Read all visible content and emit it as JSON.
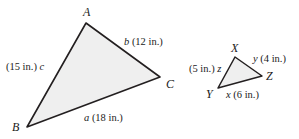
{
  "figure": {
    "background_color": "#ffffff",
    "stroke_color": "#231f20",
    "fill_color": "#efefef"
  },
  "triangle_abc": {
    "name": "Triangle ABC",
    "vertices": [
      {
        "label": "A",
        "x": 86,
        "y": 23
      },
      {
        "label": "B",
        "x": 27,
        "y": 127
      },
      {
        "label": "C",
        "x": 160,
        "y": 77
      }
    ],
    "sides": [
      {
        "var": "a",
        "measure": "(18 in.)",
        "text": "a (18 in.)",
        "length": 18,
        "unit": "in.",
        "between": "B-C"
      },
      {
        "var": "b",
        "measure": "(12 in.)",
        "text": "b (12 in.)",
        "length": 12,
        "unit": "in.",
        "between": "A-C"
      },
      {
        "var": "c",
        "measure": "(15 in.)",
        "text": "(15 in.) c",
        "length": 15,
        "unit": "in.",
        "between": "A-B"
      }
    ],
    "labels": {
      "vertex_a": "A",
      "vertex_b": "B",
      "vertex_c": "C",
      "side_a_var": "a",
      "side_a_measure": "(18 in.)",
      "side_b_var": "b",
      "side_b_measure": "(12 in.)",
      "side_c_var": "c",
      "side_c_measure": "(15 in.)"
    }
  },
  "triangle_xyz": {
    "name": "Triangle XYZ",
    "vertices": [
      {
        "label": "X",
        "x": 235,
        "y": 57
      },
      {
        "label": "Y",
        "x": 218,
        "y": 88
      },
      {
        "label": "Z",
        "x": 262,
        "y": 76
      }
    ],
    "sides": [
      {
        "var": "x",
        "measure": "(6 in.)",
        "text": "x (6 in.)",
        "length": 6,
        "unit": "in.",
        "between": "Y-Z"
      },
      {
        "var": "y",
        "measure": "(4 in.)",
        "text": "y (4 in.)",
        "length": 4,
        "unit": "in.",
        "between": "X-Z"
      },
      {
        "var": "z",
        "measure": "(5 in.)",
        "text": "(5 in.) z",
        "length": 5,
        "unit": "in.",
        "between": "X-Y"
      }
    ],
    "labels": {
      "vertex_x": "X",
      "vertex_y": "Y",
      "vertex_z": "Z",
      "side_x_var": "x",
      "side_x_measure": "(6 in.)",
      "side_y_var": "y",
      "side_y_measure": "(4 in.)",
      "side_z_var": "z",
      "side_z_measure": "(5 in.)"
    }
  }
}
